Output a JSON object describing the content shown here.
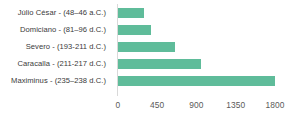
{
  "chart_data": {
    "type": "bar",
    "orientation": "horizontal",
    "title": "",
    "subtitle": "",
    "xlabel": "",
    "ylabel": "",
    "categories": [
      "Júlio César - (48–46 a.C.)",
      "Domiciano - (81–96 d.C.)",
      "Severo - (193-211 d.C.)",
      "Caracalla - (211-217 d.C.)",
      "Maximinus - (235–238 d.C.)"
    ],
    "values": [
      300,
      375,
      650,
      950,
      1800
    ],
    "xlim": [
      0,
      1800
    ],
    "xticks": [
      0,
      450,
      900,
      1350,
      1800
    ],
    "xtick_labels": [
      "0",
      "450",
      "900",
      "1350",
      "1800"
    ],
    "grid": false,
    "legend": false,
    "bar_color": "#5fbc9a",
    "axis_line_color": "#d9d9d9",
    "label_color": "#3a3a3a",
    "tick_color": "#5a5a5a",
    "background": "#ffffff"
  }
}
